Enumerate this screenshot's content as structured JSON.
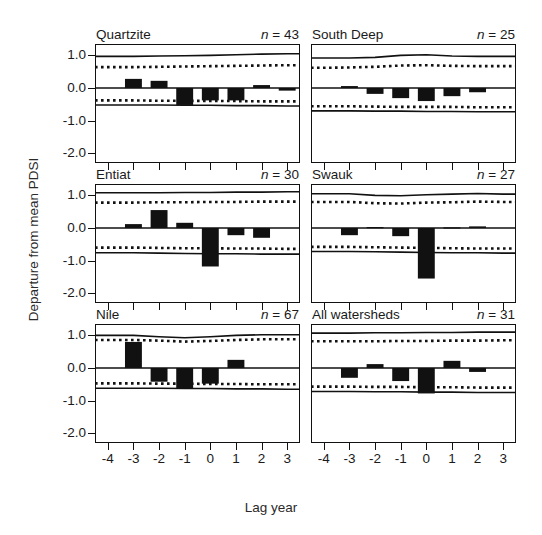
{
  "figure": {
    "xlabel": "Lag year",
    "ylabel": "Departure from mean PDSI"
  },
  "axis": {
    "yticks": [
      "1.0",
      "0.0",
      "-1.0",
      "-2.0"
    ],
    "xticks": [
      "-4",
      "-3",
      "-2",
      "-1",
      "0",
      "1",
      "2",
      "3"
    ]
  },
  "chart_data": {
    "type": "bar",
    "title": "",
    "xlabel": "Lag year",
    "ylabel": "Departure from mean PDSI",
    "categories": [
      -4,
      -3,
      -2,
      -1,
      0,
      1,
      2,
      3
    ],
    "ylim": [
      -2.3,
      1.35
    ],
    "yticks": [
      1.0,
      0.0,
      -1.0,
      -2.0
    ],
    "grid": false,
    "legend": null,
    "layout": "2 columns x 3 rows of small-multiple panels",
    "annotations": "Each panel shows the sample size as 'n = value' at upper right; solid curves are outer confidence limits and dotted curves are inner confidence limits.",
    "panels": [
      {
        "name": "Quartzite",
        "n_label": "n = 43",
        "n": 43,
        "values": [
          0.0,
          0.28,
          0.22,
          -0.52,
          -0.38,
          -0.38,
          0.09,
          -0.08
        ],
        "upper_solid": [
          0.97,
          0.97,
          0.98,
          0.99,
          1.0,
          1.02,
          1.04,
          1.05
        ],
        "upper_dotted": [
          0.64,
          0.64,
          0.65,
          0.66,
          0.67,
          0.68,
          0.69,
          0.7
        ],
        "lower_dotted": [
          -0.38,
          -0.38,
          -0.39,
          -0.39,
          -0.4,
          -0.4,
          -0.41,
          -0.41
        ],
        "lower_solid": [
          -0.52,
          -0.52,
          -0.52,
          -0.53,
          -0.53,
          -0.54,
          -0.54,
          -0.55
        ]
      },
      {
        "name": "South Deep",
        "n_label": "n = 25",
        "n": 25,
        "values": [
          0.0,
          0.06,
          -0.18,
          -0.31,
          -0.4,
          -0.25,
          -0.13,
          0.0
        ],
        "upper_solid": [
          0.92,
          0.92,
          0.94,
          1.0,
          1.02,
          0.98,
          0.97,
          0.97
        ],
        "upper_dotted": [
          0.62,
          0.63,
          0.65,
          0.69,
          0.7,
          0.68,
          0.67,
          0.67
        ],
        "lower_dotted": [
          -0.56,
          -0.56,
          -0.57,
          -0.58,
          -0.58,
          -0.58,
          -0.59,
          -0.59
        ],
        "lower_solid": [
          -0.7,
          -0.7,
          -0.71,
          -0.71,
          -0.72,
          -0.72,
          -0.73,
          -0.73
        ]
      },
      {
        "name": "Entiat",
        "n_label": "n = 30",
        "n": 30,
        "values": [
          0.0,
          0.12,
          0.55,
          0.16,
          -1.18,
          -0.22,
          -0.3,
          0.0
        ],
        "upper_solid": [
          1.08,
          1.08,
          1.08,
          1.09,
          1.09,
          1.1,
          1.1,
          1.11
        ],
        "upper_dotted": [
          0.78,
          0.78,
          0.79,
          0.79,
          0.8,
          0.8,
          0.81,
          0.81
        ],
        "lower_dotted": [
          -0.6,
          -0.6,
          -0.61,
          -0.62,
          -0.62,
          -0.63,
          -0.63,
          -0.64
        ],
        "lower_solid": [
          -0.76,
          -0.76,
          -0.77,
          -0.78,
          -0.79,
          -0.79,
          -0.8,
          -0.8
        ]
      },
      {
        "name": "Swauk",
        "n_label": "n = 27",
        "n": 27,
        "values": [
          0.0,
          -0.22,
          0.03,
          -0.25,
          -1.55,
          0.02,
          0.05,
          0.0
        ],
        "upper_solid": [
          1.05,
          1.05,
          1.0,
          0.99,
          1.02,
          1.04,
          1.06,
          1.04
        ],
        "upper_dotted": [
          0.8,
          0.8,
          0.76,
          0.75,
          0.78,
          0.79,
          0.81,
          0.8
        ],
        "lower_dotted": [
          -0.58,
          -0.58,
          -0.59,
          -0.6,
          -0.61,
          -0.62,
          -0.63,
          -0.63
        ],
        "lower_solid": [
          -0.72,
          -0.72,
          -0.73,
          -0.74,
          -0.75,
          -0.76,
          -0.76,
          -0.77
        ]
      },
      {
        "name": "Nile",
        "n_label": "n = 67",
        "n": 67,
        "values": [
          0.0,
          0.8,
          -0.42,
          -0.62,
          -0.48,
          0.25,
          0.0,
          0.0
        ],
        "upper_solid": [
          1.0,
          1.0,
          0.96,
          0.93,
          0.96,
          1.0,
          1.02,
          1.02
        ],
        "upper_dotted": [
          0.86,
          0.86,
          0.84,
          0.81,
          0.83,
          0.86,
          0.88,
          0.88
        ],
        "lower_dotted": [
          -0.47,
          -0.47,
          -0.48,
          -0.48,
          -0.49,
          -0.49,
          -0.5,
          -0.5
        ],
        "lower_solid": [
          -0.62,
          -0.62,
          -0.62,
          -0.63,
          -0.63,
          -0.64,
          -0.64,
          -0.65
        ]
      },
      {
        "name": "All watersheds",
        "n_label": "n = 31",
        "n": 31,
        "values": [
          0.0,
          -0.3,
          0.12,
          -0.4,
          -0.78,
          0.22,
          -0.12,
          0.0
        ],
        "upper_solid": [
          1.07,
          1.07,
          1.08,
          1.08,
          1.09,
          1.09,
          1.1,
          1.1
        ],
        "upper_dotted": [
          0.82,
          0.82,
          0.82,
          0.83,
          0.83,
          0.84,
          0.84,
          0.85
        ],
        "lower_dotted": [
          -0.57,
          -0.57,
          -0.58,
          -0.58,
          -0.59,
          -0.59,
          -0.6,
          -0.6
        ],
        "lower_solid": [
          -0.72,
          -0.72,
          -0.73,
          -0.73,
          -0.74,
          -0.74,
          -0.75,
          -0.75
        ]
      }
    ]
  }
}
